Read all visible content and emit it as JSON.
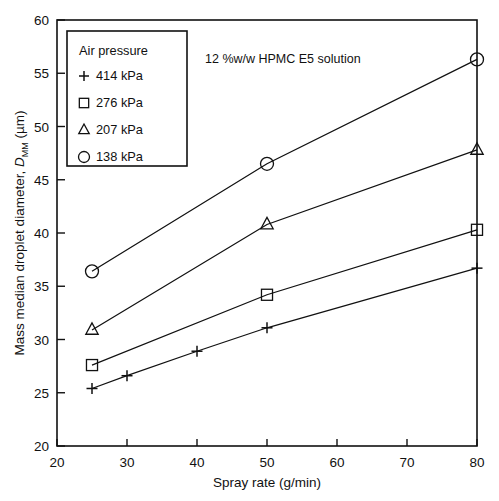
{
  "chart_data": {
    "type": "line",
    "title": "",
    "annotation": "12 %w/w HPMC E5 solution",
    "xlabel": "Spray rate (g/min)",
    "ylabel_prefix": "Mass median droplet diameter, ",
    "ylabel_symbol": "D",
    "ylabel_symbol_sub": "MM",
    "ylabel_suffix": " (µm)",
    "xlim": [
      20,
      80
    ],
    "ylim": [
      20,
      60
    ],
    "xticks": [
      20,
      30,
      40,
      50,
      60,
      70,
      80
    ],
    "yticks": [
      20,
      25,
      30,
      35,
      40,
      45,
      50,
      55,
      60
    ],
    "xticklabels": [
      "20",
      "30",
      "40",
      "50",
      "60",
      "70",
      "80"
    ],
    "yticklabels": [
      "20",
      "25",
      "30",
      "35",
      "40",
      "45",
      "50",
      "55",
      "60"
    ],
    "grid": false,
    "legend_position": "upper-left",
    "series": [
      {
        "name": "414 kPa",
        "marker": "plus",
        "x": [
          25,
          30,
          40,
          50,
          80
        ],
        "y": [
          25.4,
          26.6,
          28.9,
          31.1,
          36.7
        ]
      },
      {
        "name": "276 kPa",
        "marker": "square",
        "x": [
          25,
          50,
          80
        ],
        "y": [
          27.6,
          34.2,
          40.3
        ]
      },
      {
        "name": "207 kPa",
        "marker": "triangle",
        "x": [
          25,
          50,
          80
        ],
        "y": [
          30.9,
          40.8,
          47.8
        ]
      },
      {
        "name": "138 kPa",
        "marker": "circle",
        "x": [
          25,
          50,
          80
        ],
        "y": [
          36.4,
          46.5,
          56.3
        ]
      }
    ]
  },
  "legend": {
    "title": "Air pressure",
    "entries": [
      {
        "marker": "plus",
        "label": "414 kPa"
      },
      {
        "marker": "square",
        "label": "276 kPa"
      },
      {
        "marker": "triangle",
        "label": "207 kPa"
      },
      {
        "marker": "circle",
        "label": "138 kPa"
      }
    ]
  },
  "colors": {
    "ink": "#111111",
    "background": "#ffffff"
  }
}
